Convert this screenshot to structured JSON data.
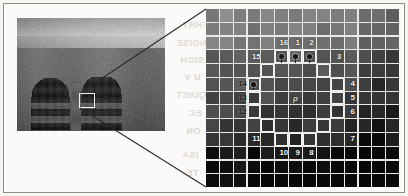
{
  "figure": {
    "center_pixel_label": "p",
    "photo": {
      "name": "grayscale-architecture-photo",
      "roi_label": ""
    }
  },
  "grid": {
    "columns": 14,
    "rows": 13,
    "background_hex": "#e9e9e5"
  },
  "neighbourhood": {
    "center": {
      "label": "p",
      "col": 7,
      "row": 7
    },
    "points": [
      {
        "label": "1",
        "col": 7,
        "row": 4,
        "num_col": 7,
        "num_row": 3,
        "num_tone": "light",
        "dot": true
      },
      {
        "label": "2",
        "col": 8,
        "row": 4,
        "num_col": 8,
        "num_row": 3,
        "num_tone": "light",
        "dot": true
      },
      {
        "label": "3",
        "col": 9,
        "row": 5,
        "num_col": 10,
        "num_row": 4,
        "num_tone": "light",
        "dot": false
      },
      {
        "label": "4",
        "col": 10,
        "row": 6,
        "num_col": 11,
        "num_row": 6,
        "num_tone": "light",
        "dot": false
      },
      {
        "label": "5",
        "col": 10,
        "row": 7,
        "num_col": 11,
        "num_row": 7,
        "num_tone": "light",
        "dot": false
      },
      {
        "label": "6",
        "col": 10,
        "row": 8,
        "num_col": 11,
        "num_row": 8,
        "num_tone": "light",
        "dot": false
      },
      {
        "label": "7",
        "col": 9,
        "row": 9,
        "num_col": 11,
        "num_row": 10,
        "num_tone": "light",
        "dot": false
      },
      {
        "label": "8",
        "col": 8,
        "row": 10,
        "num_col": 8,
        "num_row": 11,
        "num_tone": "light",
        "dot": false
      },
      {
        "label": "9",
        "col": 7,
        "row": 10,
        "num_col": 7,
        "num_row": 11,
        "num_tone": "light",
        "dot": false
      },
      {
        "label": "10",
        "col": 6,
        "row": 10,
        "num_col": 6,
        "num_row": 11,
        "num_tone": "light",
        "dot": false
      },
      {
        "label": "11",
        "col": 5,
        "row": 9,
        "num_col": 4,
        "num_row": 10,
        "num_tone": "light",
        "dot": false
      },
      {
        "label": "12",
        "col": 4,
        "row": 8,
        "num_col": 3,
        "num_row": 8,
        "num_tone": "dark",
        "dot": false
      },
      {
        "label": "13",
        "col": 4,
        "row": 7,
        "num_col": 3,
        "num_row": 7,
        "num_tone": "dark",
        "dot": false
      },
      {
        "label": "14",
        "col": 4,
        "row": 6,
        "num_col": 3,
        "num_row": 6,
        "num_tone": "dark",
        "dot": true
      },
      {
        "label": "15",
        "col": 5,
        "row": 5,
        "num_col": 4,
        "num_row": 4,
        "num_tone": "light",
        "dot": false
      },
      {
        "label": "16",
        "col": 6,
        "row": 4,
        "num_col": 6,
        "num_row": 3,
        "num_tone": "light",
        "dot": true
      }
    ]
  },
  "bleed_text": [
    {
      "text": "FHRT",
      "x": 182,
      "y": 20
    },
    {
      "text": "NOISE",
      "x": 176,
      "y": 38
    },
    {
      "text": "SIGH",
      "x": 180,
      "y": 55
    },
    {
      "text": "U V",
      "x": 184,
      "y": 72
    },
    {
      "text": "QUIET",
      "x": 176,
      "y": 90
    },
    {
      "text": "EC",
      "x": 188,
      "y": 108
    },
    {
      "text": "ON",
      "x": 186,
      "y": 126
    },
    {
      "text": "ISA",
      "x": 182,
      "y": 150
    },
    {
      "text": "TE",
      "x": 186,
      "y": 168
    }
  ]
}
